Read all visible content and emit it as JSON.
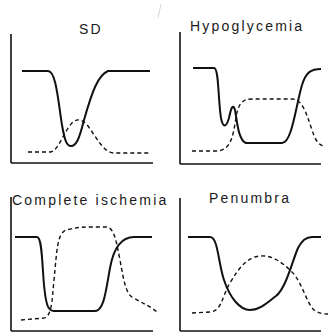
{
  "figure": {
    "panels": [
      {
        "id": "sd",
        "title": "SD"
      },
      {
        "id": "hypoglycemia",
        "title": "Hypoglycemia"
      },
      {
        "id": "complete_ischemia",
        "title": "Complete ischemia"
      },
      {
        "id": "penumbra",
        "title": "Penumbra"
      }
    ],
    "legend": {
      "solid": "solid line trace",
      "dashed": "dashed line trace"
    }
  }
}
